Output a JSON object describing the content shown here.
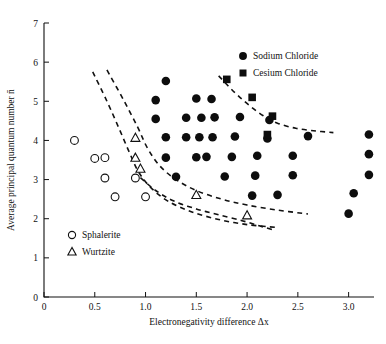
{
  "chart_data": {
    "type": "scatter",
    "title": "",
    "xlabel": "Electronegativity difference Δx",
    "ylabel": "Average principal quantum number n̄",
    "xlim": [
      0,
      3.25
    ],
    "ylim": [
      0,
      7
    ],
    "xticks": [
      "0",
      "0.5",
      "1.0",
      "1.5",
      "2.0",
      "2.5",
      "3.0"
    ],
    "xtick_values": [
      0,
      0.5,
      1.0,
      1.5,
      2.0,
      2.5,
      3.0
    ],
    "yticks": [
      "0",
      "1",
      "2",
      "3",
      "4",
      "5",
      "6",
      "7"
    ],
    "ytick_values": [
      0,
      1,
      2,
      3,
      4,
      5,
      6,
      7
    ],
    "grid": false,
    "legend_position": "top-right and lower-left",
    "series": [
      {
        "name": "Sodium Chloride",
        "marker": "filled-circle",
        "color": "#0d0d0d",
        "points": [
          [
            1.2,
            5.52
          ],
          [
            1.1,
            5.03
          ],
          [
            1.5,
            5.07
          ],
          [
            1.65,
            5.06
          ],
          [
            1.1,
            4.55
          ],
          [
            1.4,
            4.58
          ],
          [
            1.55,
            4.58
          ],
          [
            1.68,
            4.59
          ],
          [
            1.93,
            4.6
          ],
          [
            2.22,
            4.52
          ],
          [
            1.2,
            4.08
          ],
          [
            1.4,
            4.08
          ],
          [
            1.53,
            4.08
          ],
          [
            1.66,
            4.08
          ],
          [
            1.88,
            4.1
          ],
          [
            2.2,
            4.05
          ],
          [
            2.6,
            4.11
          ],
          [
            3.2,
            4.15
          ],
          [
            1.2,
            3.56
          ],
          [
            1.5,
            3.57
          ],
          [
            1.6,
            3.58
          ],
          [
            1.85,
            3.58
          ],
          [
            2.1,
            3.61
          ],
          [
            2.45,
            3.61
          ],
          [
            3.2,
            3.65
          ],
          [
            1.3,
            3.07
          ],
          [
            1.78,
            3.08
          ],
          [
            2.08,
            3.1
          ],
          [
            2.45,
            3.11
          ],
          [
            3.2,
            3.12
          ],
          [
            2.05,
            2.59
          ],
          [
            2.3,
            2.61
          ],
          [
            3.05,
            2.65
          ],
          [
            3.0,
            2.13
          ]
        ]
      },
      {
        "name": "Cesium Chloride",
        "marker": "filled-square",
        "color": "#0d0d0d",
        "points": [
          [
            1.8,
            5.56
          ],
          [
            2.05,
            5.1
          ],
          [
            2.25,
            4.62
          ],
          [
            2.2,
            4.15
          ]
        ]
      },
      {
        "name": "Sphalerite",
        "marker": "open-circle",
        "color": "#ffffff",
        "points": [
          [
            0.3,
            4.0
          ],
          [
            0.5,
            3.54
          ],
          [
            0.6,
            3.56
          ],
          [
            0.6,
            3.04
          ],
          [
            0.7,
            2.56
          ],
          [
            0.9,
            3.04
          ],
          [
            1.0,
            2.56
          ]
        ]
      },
      {
        "name": "Wurtzite",
        "marker": "open-triangle",
        "color": "#ffffff",
        "points": [
          [
            0.9,
            4.06
          ],
          [
            0.9,
            3.55
          ],
          [
            0.95,
            3.27
          ],
          [
            1.5,
            2.6
          ],
          [
            2.0,
            2.08
          ]
        ]
      }
    ],
    "boundaries": [
      {
        "name": "sphalerite-wurtzite-divider",
        "style": "dashed",
        "path": [
          [
            0.48,
            5.75
          ],
          [
            0.62,
            5.0
          ],
          [
            0.74,
            4.3
          ],
          [
            0.84,
            3.7
          ],
          [
            0.93,
            3.2
          ],
          [
            1.05,
            2.8
          ],
          [
            1.22,
            2.45
          ],
          [
            1.45,
            2.18
          ],
          [
            1.72,
            1.98
          ],
          [
            2.0,
            1.85
          ],
          [
            2.28,
            1.78
          ]
        ]
      },
      {
        "name": "wurtzite-rocksalt-divider",
        "style": "dashed",
        "path": [
          [
            0.62,
            5.8
          ],
          [
            0.78,
            5.05
          ],
          [
            0.92,
            4.35
          ],
          [
            1.02,
            3.8
          ],
          [
            1.14,
            3.35
          ],
          [
            1.3,
            3.0
          ],
          [
            1.5,
            2.72
          ],
          [
            1.75,
            2.5
          ],
          [
            2.0,
            2.35
          ],
          [
            2.3,
            2.22
          ],
          [
            2.6,
            2.12
          ]
        ]
      },
      {
        "name": "lower-boundary",
        "style": "dashed",
        "path": [
          [
            0.95,
            3.05
          ],
          [
            1.1,
            2.72
          ],
          [
            1.28,
            2.45
          ],
          [
            1.5,
            2.25
          ],
          [
            1.72,
            2.1
          ],
          [
            1.95,
            1.95
          ],
          [
            2.12,
            1.82
          ],
          [
            2.25,
            1.72
          ]
        ]
      },
      {
        "name": "rocksalt-cesiumchloride-divider",
        "style": "dashed",
        "path": [
          [
            1.72,
            5.65
          ],
          [
            1.88,
            5.22
          ],
          [
            2.02,
            4.9
          ],
          [
            2.16,
            4.63
          ],
          [
            2.3,
            4.44
          ],
          [
            2.48,
            4.31
          ],
          [
            2.68,
            4.24
          ],
          [
            2.85,
            4.2
          ]
        ]
      }
    ]
  },
  "legend": {
    "primary": [
      {
        "label": "Sodium Chloride",
        "marker": "filled-circle"
      },
      {
        "label": "Cesium Chloride",
        "marker": "filled-square"
      }
    ],
    "secondary": [
      {
        "label": "Sphalerite",
        "marker": "open-circle"
      },
      {
        "label": "Wurtzite",
        "marker": "open-triangle"
      }
    ]
  }
}
